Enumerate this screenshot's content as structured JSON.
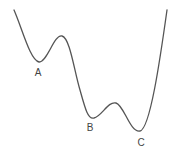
{
  "diagram": {
    "type": "energy-landscape-curve",
    "line_color": "#555555",
    "label_color": "#444444",
    "minima": [
      {
        "label": "A",
        "x": 39,
        "y": 62,
        "label_x": 38,
        "label_y": 76
      },
      {
        "label": "B",
        "x": 93,
        "y": 118,
        "label_x": 90,
        "label_y": 131
      },
      {
        "label": "C",
        "x": 140,
        "y": 131,
        "label_x": 141,
        "label_y": 146
      }
    ]
  }
}
